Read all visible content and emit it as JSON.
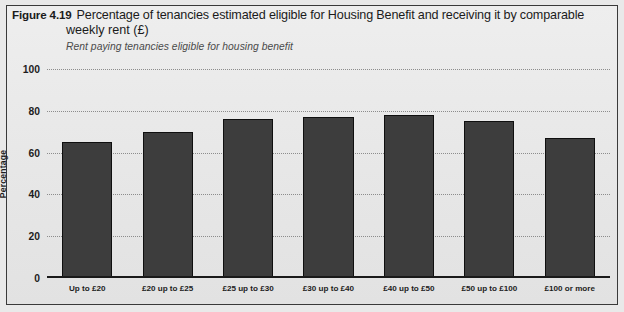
{
  "figure": {
    "number": "Figure 4.19",
    "title_line1": "Percentage of tenancies estimated eligible for Housing Benefit and receiving it by comparable",
    "title_line2": "weekly rent (£)",
    "subtitle": "Rent paying tenancies eligible  for housing benefit"
  },
  "colors": {
    "bar_fill": "#3d3d3d",
    "bar_outline": "#0f0f0f",
    "background": "#e9e9e9",
    "gridline": "#8c8c8c",
    "text": "#1d1d1d"
  },
  "chart_data": {
    "type": "bar",
    "title": "Percentage of tenancies estimated eligible for Housing Benefit and receiving it by comparable weekly rent (£)",
    "subtitle": "Rent paying tenancies eligible  for housing benefit",
    "xlabel": "",
    "ylabel": "Percentage",
    "ylim": [
      0,
      100
    ],
    "yticks": [
      0,
      20,
      40,
      60,
      80,
      100
    ],
    "grid": true,
    "legend": false,
    "categories": [
      "Up to £20",
      "£20 up to £25",
      "£25 up to  £30",
      "£30 up to  £40",
      "£40 up to  £50",
      "£50 up to  £100",
      "£100 or more"
    ],
    "values": [
      65,
      70,
      76,
      77,
      78,
      75,
      67
    ]
  }
}
